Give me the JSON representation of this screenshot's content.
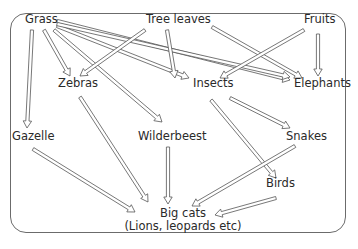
{
  "diagram": {
    "type": "food-web",
    "nodes": [
      {
        "id": "grass",
        "label": "Grass",
        "x": 16,
        "y": 19
      },
      {
        "id": "tree_leaves",
        "label": "Tree leaves",
        "x": 146,
        "y": 19
      },
      {
        "id": "fruits",
        "label": "Fruits",
        "x": 304,
        "y": 19
      },
      {
        "id": "zebras",
        "label": "Zebras",
        "x": 58,
        "y": 82
      },
      {
        "id": "insects",
        "label": "Insects",
        "x": 191,
        "y": 82
      },
      {
        "id": "elephants",
        "label": "Elephants",
        "x": 292,
        "y": 82
      },
      {
        "id": "gazelle",
        "label": "Gazelle",
        "x": 12,
        "y": 134
      },
      {
        "id": "wilderbeest",
        "label": "Wilderbeest",
        "x": 138,
        "y": 134
      },
      {
        "id": "snakes",
        "label": "Snakes",
        "x": 286,
        "y": 134
      },
      {
        "id": "birds",
        "label": "Birds",
        "x": 266,
        "y": 181
      },
      {
        "id": "big_cats",
        "label": "Big cats",
        "sublabel": "(Lions, leopards etc)",
        "x": 118,
        "y": 211
      }
    ],
    "edges": [
      {
        "from": "grass",
        "to": "gazelle"
      },
      {
        "from": "grass",
        "to": "zebras"
      },
      {
        "from": "grass",
        "to": "wilderbeest"
      },
      {
        "from": "grass",
        "to": "insects"
      },
      {
        "from": "grass",
        "to": "elephants"
      },
      {
        "from": "grass",
        "to": "elephants_2"
      },
      {
        "from": "tree_leaves",
        "to": "zebras"
      },
      {
        "from": "tree_leaves",
        "to": "insects"
      },
      {
        "from": "tree_leaves",
        "to": "elephants"
      },
      {
        "from": "fruits",
        "to": "insects"
      },
      {
        "from": "fruits",
        "to": "elephants"
      },
      {
        "from": "zebras",
        "to": "big_cats"
      },
      {
        "from": "gazelle",
        "to": "big_cats"
      },
      {
        "from": "wilderbeest",
        "to": "big_cats"
      },
      {
        "from": "insects",
        "to": "snakes"
      },
      {
        "from": "insects",
        "to": "birds"
      },
      {
        "from": "snakes",
        "to": "big_cats"
      },
      {
        "from": "birds",
        "to": "big_cats"
      }
    ],
    "colors": {
      "frame": "#6b6b6b",
      "arrow": "#555555",
      "text": "#2a2a2a"
    }
  }
}
